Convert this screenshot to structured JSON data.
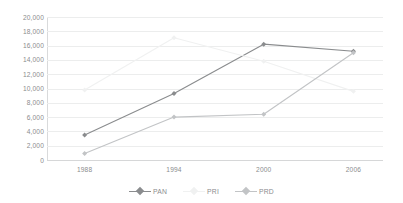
{
  "chart_data": {
    "type": "line",
    "title": "",
    "subtitle": "",
    "xlabel": "",
    "ylabel": "",
    "categories": [
      "1988",
      "1994",
      "2000",
      "2006"
    ],
    "x": [
      1988,
      1994,
      2000,
      2006
    ],
    "ylim": [
      0,
      20000
    ],
    "y_ticks": [
      "20,000",
      "18,000",
      "16,000",
      "14,000",
      "12,000",
      "10,000",
      "8,000",
      "6,000",
      "4,000",
      "2,000",
      "0"
    ],
    "y_tick_values": [
      20000,
      18000,
      16000,
      14000,
      12000,
      10000,
      8000,
      6000,
      4000,
      2000,
      0
    ],
    "grid": true,
    "grid_axis": "y",
    "legend_position": "bottom",
    "series": [
      {
        "name": "PAN",
        "color": "#8a8c8e",
        "marker": "diamond",
        "values": [
          3500,
          9300,
          16200,
          15200
        ]
      },
      {
        "name": "PRI",
        "color": "#f0f1f1",
        "marker": "diamond",
        "values": [
          9800,
          17100,
          13800,
          9600
        ]
      },
      {
        "name": "PRD",
        "color": "#c2c4c6",
        "marker": "diamond",
        "values": [
          900,
          6000,
          6400,
          15000
        ]
      }
    ]
  },
  "legend": {
    "items": [
      {
        "label": "PAN",
        "color": "#8a8c8e"
      },
      {
        "label": "PRI",
        "color": "#f0f1f1"
      },
      {
        "label": "PRD",
        "color": "#c2c4c6"
      }
    ]
  },
  "colors": {
    "background": "#ffffff",
    "gridline": "#eceded",
    "axis": "#d9dadb",
    "tick_text": "#8b8c8e",
    "pan": "#8a8c8e",
    "pri": "#f0f1f1",
    "prd": "#c2c4c6"
  }
}
